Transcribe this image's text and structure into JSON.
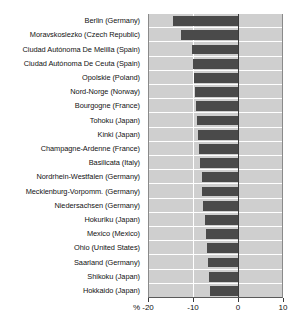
{
  "chart_data": {
    "type": "bar",
    "orientation": "horizontal",
    "title": "",
    "xlabel": "%",
    "ylabel": "",
    "xlim": [
      -20,
      10
    ],
    "ticks": [
      -20,
      -10,
      0,
      10
    ],
    "tick_labels": [
      "-20",
      "-10",
      "0",
      "10"
    ],
    "grid": true,
    "legend": "none",
    "unit_prefix": "%",
    "bar_color": "#4a4a4a",
    "plot_background": "#cfcfcf",
    "gridline_color": "#ffffff",
    "categories": [
      "Berlin (Germany)",
      "Moravskoslezko (Czech Republic)",
      "Ciudad Autónoma De Melilla  (Spain)",
      "Ciudad Autónoma De Ceuta (Spain)",
      "Opolskie (Poland)",
      "Nord-Norge (Norway)",
      "Bourgogne (France)",
      "Tohoku (Japan)",
      "Kinki (Japan)",
      "Champagne-Ardenne (France)",
      "Basilicata (Italy)",
      "Nordrhein-Westfalen (Germany)",
      "Mecklenburg-Vorpomm. (Germany)",
      "Niedersachsen (Germany)",
      "Hokuriku (Japan)",
      "Mexico (Mexico)",
      "Ohio (United States)",
      "Saarland (Germany)",
      "Shikoku (Japan)",
      "Hokkaido (Japan)"
    ],
    "values": [
      -14.5,
      -12.6,
      -10.2,
      -10.0,
      -9.8,
      -9.6,
      -9.4,
      -9.2,
      -8.9,
      -8.7,
      -8.5,
      -8.1,
      -7.9,
      -7.7,
      -7.4,
      -7.2,
      -7.0,
      -6.6,
      -6.4,
      -6.2
    ]
  }
}
